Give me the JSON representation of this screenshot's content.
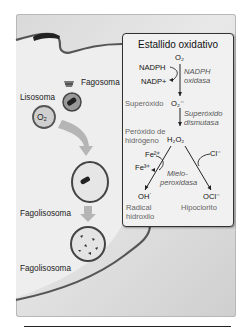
{
  "diagram": {
    "cell_labels": {
      "phagosome": "Fagosoma",
      "lysosome": "Lisosoma",
      "lysosome_content": "O₂",
      "phagolysosome_1": "Fagolisosoma",
      "phagolysosome_2": "Fagolisosoma"
    },
    "oxidative_burst": {
      "title": "Estallido oxidativo",
      "o2": "O₂",
      "nadph": "NADPH",
      "nadp": "NADP+",
      "enzyme1": [
        "NADPH",
        "oxidasa"
      ],
      "superoxide_label": "Superóxido",
      "superoxide": "O₂⁻",
      "enzyme2": [
        "Superóxido",
        "dismutasa"
      ],
      "peroxide_label": [
        "Peróxido de",
        "hidrógeno"
      ],
      "peroxide": "H₂O₂",
      "fe2": "Fe²⁺",
      "fe3": "Fe³⁺",
      "cl": "Cl⁻",
      "enzyme3": [
        "Mielo-",
        "peroxidasa"
      ],
      "hydroxyl": "OH˙",
      "hypochlorite": "OCl⁻",
      "hydroxyl_label": [
        "Radical",
        "hidroxilo"
      ],
      "hypochlorite_label": "Hipoclorito"
    },
    "colors": {
      "membrane": "#555555",
      "background": "#dcdcdc",
      "box_fill": "#f1f1f1",
      "arrow_fill": "#b5b5b5"
    }
  }
}
